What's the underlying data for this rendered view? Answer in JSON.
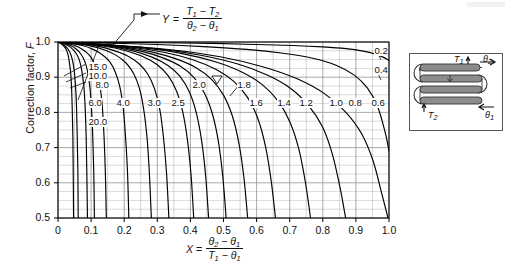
{
  "chart_data": {
    "type": "line",
    "title": "",
    "xlabel": "X = (theta2 - theta1) / (T1 - theta1)",
    "ylabel": "Correction factor, F",
    "xlim": [
      0.0,
      1.0
    ],
    "ylim": [
      0.5,
      1.0
    ],
    "grid": true,
    "legend_position": "inline-curve-labels",
    "x_ticks": [
      "0",
      "0.1",
      "0.2",
      "0.3",
      "0.4",
      "0.5",
      "0.6",
      "0.7",
      "0.8",
      "0.9",
      "1.0"
    ],
    "y_ticks": [
      "0.5",
      "0.6",
      "0.7",
      "0.8",
      "0.9",
      "1.0"
    ],
    "parameter_symbol": "Y",
    "parameter_definition_numerator": "T1 - T2",
    "parameter_definition_denominator": "theta2 - theta1",
    "series": [
      {
        "name": "20.0",
        "label": "20.0",
        "x": [
          0.0,
          0.008,
          0.016,
          0.024,
          0.03,
          0.034,
          0.038,
          0.041,
          0.043,
          0.045,
          0.046,
          0.047
        ],
        "y": [
          1.0,
          0.996,
          0.99,
          0.98,
          0.965,
          0.945,
          0.915,
          0.87,
          0.81,
          0.73,
          0.63,
          0.5
        ]
      },
      {
        "name": "15.0",
        "label": "15.0",
        "x": [
          0.0,
          0.01,
          0.02,
          0.03,
          0.038,
          0.044,
          0.049,
          0.053,
          0.056,
          0.058,
          0.06,
          0.061
        ],
        "y": [
          1.0,
          0.996,
          0.99,
          0.98,
          0.966,
          0.947,
          0.918,
          0.875,
          0.815,
          0.735,
          0.635,
          0.5
        ]
      },
      {
        "name": "10.0",
        "label": "10.0",
        "x": [
          0.0,
          0.015,
          0.03,
          0.044,
          0.056,
          0.065,
          0.072,
          0.078,
          0.082,
          0.085,
          0.087,
          0.089
        ],
        "y": [
          1.0,
          0.996,
          0.99,
          0.98,
          0.966,
          0.947,
          0.918,
          0.875,
          0.815,
          0.733,
          0.632,
          0.5
        ]
      },
      {
        "name": "8.0",
        "label": "8.0",
        "x": [
          0.0,
          0.019,
          0.038,
          0.055,
          0.069,
          0.08,
          0.089,
          0.096,
          0.101,
          0.105,
          0.108,
          0.11
        ],
        "y": [
          1.0,
          0.996,
          0.99,
          0.98,
          0.966,
          0.947,
          0.918,
          0.875,
          0.815,
          0.733,
          0.632,
          0.5
        ]
      },
      {
        "name": "6.0",
        "label": "6.0",
        "x": [
          0.0,
          0.025,
          0.05,
          0.072,
          0.091,
          0.106,
          0.118,
          0.127,
          0.134,
          0.139,
          0.143,
          0.146
        ],
        "y": [
          1.0,
          0.996,
          0.99,
          0.98,
          0.966,
          0.947,
          0.918,
          0.875,
          0.815,
          0.733,
          0.632,
          0.5
        ]
      },
      {
        "name": "4.0",
        "label": "4.0",
        "x": [
          0.0,
          0.037,
          0.074,
          0.106,
          0.134,
          0.156,
          0.173,
          0.187,
          0.197,
          0.204,
          0.21,
          0.214
        ],
        "y": [
          1.0,
          0.996,
          0.99,
          0.979,
          0.964,
          0.944,
          0.915,
          0.872,
          0.812,
          0.731,
          0.63,
          0.5
        ]
      },
      {
        "name": "3.0",
        "label": "3.0",
        "x": [
          0.0,
          0.049,
          0.097,
          0.139,
          0.176,
          0.205,
          0.228,
          0.246,
          0.259,
          0.269,
          0.276,
          0.282
        ],
        "y": [
          1.0,
          0.996,
          0.989,
          0.978,
          0.962,
          0.941,
          0.911,
          0.868,
          0.808,
          0.728,
          0.628,
          0.5
        ]
      },
      {
        "name": "2.5",
        "label": "2.5",
        "x": [
          0.0,
          0.058,
          0.115,
          0.165,
          0.209,
          0.244,
          0.271,
          0.292,
          0.308,
          0.319,
          0.328,
          0.335
        ],
        "y": [
          1.0,
          0.996,
          0.989,
          0.977,
          0.961,
          0.939,
          0.909,
          0.866,
          0.806,
          0.726,
          0.626,
          0.5
        ]
      },
      {
        "name": "2.0",
        "label": "2.0",
        "x": [
          0.0,
          0.071,
          0.141,
          0.202,
          0.256,
          0.299,
          0.332,
          0.358,
          0.377,
          0.391,
          0.402,
          0.41
        ],
        "y": [
          1.0,
          0.995,
          0.988,
          0.976,
          0.959,
          0.936,
          0.905,
          0.861,
          0.801,
          0.722,
          0.622,
          0.5
        ]
      },
      {
        "name": "1.8",
        "label": "1.8",
        "x": [
          0.0,
          0.078,
          0.156,
          0.224,
          0.284,
          0.331,
          0.368,
          0.397,
          0.418,
          0.434,
          0.446,
          0.455
        ],
        "y": [
          1.0,
          0.995,
          0.988,
          0.975,
          0.957,
          0.934,
          0.903,
          0.858,
          0.798,
          0.719,
          0.62,
          0.5
        ]
      },
      {
        "name": "1.6",
        "label": "1.6",
        "x": [
          0.0,
          0.087,
          0.174,
          0.25,
          0.317,
          0.37,
          0.411,
          0.443,
          0.467,
          0.485,
          0.498,
          0.508
        ],
        "y": [
          1.0,
          0.995,
          0.987,
          0.974,
          0.955,
          0.931,
          0.899,
          0.854,
          0.794,
          0.715,
          0.616,
          0.5
        ]
      },
      {
        "name": "1.4",
        "label": "1.4",
        "x": [
          0.0,
          0.098,
          0.196,
          0.282,
          0.357,
          0.417,
          0.464,
          0.5,
          0.527,
          0.547,
          0.562,
          0.573
        ],
        "y": [
          1.0,
          0.994,
          0.986,
          0.972,
          0.952,
          0.927,
          0.894,
          0.849,
          0.789,
          0.71,
          0.612,
          0.5
        ]
      },
      {
        "name": "1.2",
        "label": "1.2",
        "x": [
          0.0,
          0.112,
          0.224,
          0.323,
          0.409,
          0.478,
          0.531,
          0.573,
          0.604,
          0.627,
          0.644,
          0.657
        ],
        "y": [
          1.0,
          0.994,
          0.985,
          0.97,
          0.949,
          0.922,
          0.888,
          0.842,
          0.782,
          0.703,
          0.606,
          0.5
        ]
      },
      {
        "name": "1.0",
        "label": "1.0",
        "x": [
          0.0,
          0.13,
          0.26,
          0.375,
          0.475,
          0.555,
          0.617,
          0.665,
          0.701,
          0.728,
          0.748,
          0.763
        ],
        "y": [
          1.0,
          0.993,
          0.983,
          0.967,
          0.944,
          0.915,
          0.879,
          0.832,
          0.772,
          0.694,
          0.598,
          0.5
        ]
      },
      {
        "name": "0.8",
        "label": "0.8",
        "x": [
          0.0,
          0.148,
          0.296,
          0.427,
          0.541,
          0.632,
          0.703,
          0.757,
          0.799,
          0.829,
          0.852,
          0.869
        ],
        "y": [
          1.0,
          0.992,
          0.981,
          0.963,
          0.938,
          0.906,
          0.868,
          0.819,
          0.759,
          0.681,
          0.587,
          0.5
        ]
      },
      {
        "name": "0.6",
        "label": "0.6",
        "x": [
          0.0,
          0.17,
          0.34,
          0.49,
          0.621,
          0.726,
          0.807,
          0.869,
          0.917,
          0.952,
          0.978,
          0.997
        ],
        "y": [
          1.0,
          0.991,
          0.978,
          0.958,
          0.929,
          0.894,
          0.852,
          0.801,
          0.74,
          0.662,
          0.57,
          0.49
        ]
      },
      {
        "name": "0.4",
        "label": "0.4",
        "x": [
          0.0,
          0.15,
          0.3,
          0.44,
          0.57,
          0.68,
          0.77,
          0.84,
          0.895,
          0.935,
          0.965,
          0.988,
          1.0
        ],
        "y": [
          1.0,
          0.997,
          0.993,
          0.987,
          0.979,
          0.968,
          0.954,
          0.934,
          0.906,
          0.869,
          0.818,
          0.745,
          0.69
        ]
      },
      {
        "name": "0.2",
        "label": "0.2",
        "x": [
          0.0,
          0.16,
          0.32,
          0.47,
          0.6,
          0.71,
          0.8,
          0.87,
          0.922,
          0.958,
          0.982,
          1.0
        ],
        "y": [
          1.0,
          0.999,
          0.998,
          0.996,
          0.993,
          0.99,
          0.986,
          0.981,
          0.974,
          0.966,
          0.957,
          0.948
        ]
      }
    ]
  },
  "axes": {
    "y_title_text": "Correction factor, ",
    "y_title_symbol": "F",
    "x_eq_symbol": "X",
    "x_eq_equals": "=",
    "x_num_t2": "θ",
    "x_num_sub2": "2",
    "x_num_minus": "−",
    "x_num_t1": "θ",
    "x_num_sub1": "1",
    "x_den_T": "T",
    "x_den_sub1": "1",
    "x_den_minus": "−",
    "x_den_theta": "θ",
    "x_den_subt1": "1"
  },
  "y_annotation": {
    "symbol": "Y",
    "equals": "=",
    "num_T": "T",
    "num_sub1": "1",
    "num_minus": "−",
    "num_T2": "T",
    "num_sub2": "2",
    "den_theta": "θ",
    "den_sub2": "2",
    "den_minus": "−",
    "den_theta1": "θ",
    "den_sub1": "1"
  },
  "x_tick_labels": [
    "0",
    "0.1",
    "0.2",
    "0.3",
    "0.4",
    "0.5",
    "0.6",
    "0.7",
    "0.8",
    "0.9",
    "1.0"
  ],
  "y_tick_labels": [
    "1.0",
    "0.9",
    "0.8",
    "0.7",
    "0.6",
    "0.5"
  ],
  "curve_labels": [
    {
      "text": "20.0",
      "x": 88,
      "y": 117
    },
    {
      "text": "15.0",
      "x": 88,
      "y": 62
    },
    {
      "text": "10.0",
      "x": 88,
      "y": 71
    },
    {
      "text": "8.0",
      "x": 95,
      "y": 80
    },
    {
      "text": "6.0",
      "x": 88,
      "y": 98
    },
    {
      "text": "4.0",
      "x": 116,
      "y": 98
    },
    {
      "text": "3.0",
      "x": 147,
      "y": 98
    },
    {
      "text": "2.5",
      "x": 171,
      "y": 98
    },
    {
      "text": "2.0",
      "x": 192,
      "y": 80
    },
    {
      "text": "1.8",
      "x": 237,
      "y": 80
    },
    {
      "text": "1.6",
      "x": 249,
      "y": 98
    },
    {
      "text": "1.4",
      "x": 277,
      "y": 98
    },
    {
      "text": "1.2",
      "x": 299,
      "y": 98
    },
    {
      "text": "1.0",
      "x": 329,
      "y": 98
    },
    {
      "text": "0.8",
      "x": 348,
      "y": 98
    },
    {
      "text": "0.6",
      "x": 371,
      "y": 98
    },
    {
      "text": "0.4",
      "x": 374,
      "y": 65
    },
    {
      "text": "0.2",
      "x": 374,
      "y": 46
    }
  ],
  "inset": {
    "name": "heat-exchanger-schematic",
    "labels": {
      "T1": "T",
      "T1_sub": "1",
      "theta2": "θ",
      "theta2_sub": "2",
      "T2": "T",
      "T2_sub": "2",
      "theta1": "θ",
      "theta1_sub": "1"
    }
  },
  "colors": {
    "curve": "#000000",
    "grid": "#9a9a9a",
    "frame": "#000000",
    "text": "#111111",
    "inset_border": "#555555",
    "inset_tube": "#8c8c8c"
  }
}
